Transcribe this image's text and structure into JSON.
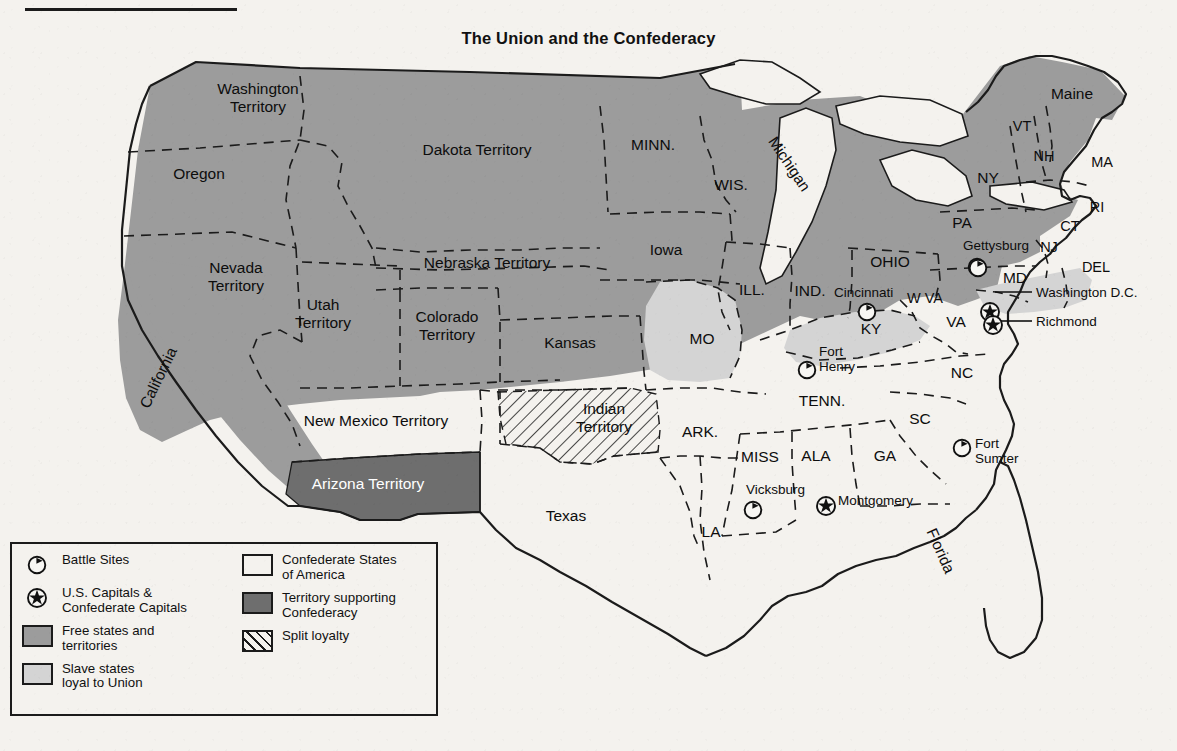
{
  "title": "The Union and the Confederacy",
  "colors": {
    "paper": "#f4f2ee",
    "free_states": "#9c9c9c",
    "slave_loyal": "#d4d4d4",
    "confederate": "#f4f2ee",
    "territory_supporting": "#6e6e6e",
    "ink": "#1b1b1b"
  },
  "legend": {
    "left_column": [
      {
        "mark": "battle-site-icon",
        "label": "Battle Sites"
      },
      {
        "mark": "capital-star-icon",
        "label": "U.S. Capitals &\nConfederate Capitals"
      },
      {
        "mark": "swatch-free",
        "label": "Free states and\nterritories"
      },
      {
        "mark": "swatch-slave",
        "label": "Slave states\nloyal to Union"
      }
    ],
    "right_column": [
      {
        "mark": "swatch-confederate",
        "label": "Confederate States\nof America"
      },
      {
        "mark": "swatch-dark",
        "label": "Territory supporting\nConfederacy"
      },
      {
        "mark": "swatch-split",
        "label": "Split loyalty"
      }
    ]
  },
  "map": {
    "free_states_and_territories": [
      {
        "name": "Washington Territory",
        "lines": [
          "Washington",
          "Territory"
        ],
        "x": 258,
        "y": 94,
        "size": "sz15"
      },
      {
        "name": "Oregon",
        "lines": [
          "Oregon"
        ],
        "x": 199,
        "y": 179,
        "size": "sz15"
      },
      {
        "name": "Dakota Territory",
        "lines": [
          "Dakota Territory"
        ],
        "x": 477,
        "y": 155,
        "size": "sz15"
      },
      {
        "name": "Nevada Territory",
        "lines": [
          "Nevada",
          "Territory"
        ],
        "x": 236,
        "y": 273,
        "size": "sz15"
      },
      {
        "name": "Utah Territory",
        "lines": [
          "Utah",
          "Territory"
        ],
        "x": 323,
        "y": 310,
        "size": "sz15"
      },
      {
        "name": "Colorado Territory",
        "lines": [
          "Colorado",
          "Territory"
        ],
        "x": 447,
        "y": 322,
        "size": "sz15"
      },
      {
        "name": "Nebraska Territory",
        "lines": [
          "Nebraska Territory"
        ],
        "x": 487,
        "y": 268,
        "size": "sz15"
      },
      {
        "name": "Kansas",
        "lines": [
          "Kansas"
        ],
        "x": 570,
        "y": 348,
        "size": "sz15"
      },
      {
        "name": "New Mexico Territory",
        "lines": [
          "New Mexico Territory"
        ],
        "x": 376,
        "y": 426,
        "size": "sz15"
      },
      {
        "name": "California",
        "lines": [
          "California"
        ],
        "x": 163,
        "y": 380,
        "size": "sz15",
        "rotate": -64
      },
      {
        "name": "MINN.",
        "lines": [
          "MINN."
        ],
        "x": 653,
        "y": 150,
        "size": "sz15"
      },
      {
        "name": "WIS.",
        "lines": [
          "WIS."
        ],
        "x": 731,
        "y": 190,
        "size": "sz15"
      },
      {
        "name": "Michigan",
        "lines": [
          "Michigan"
        ],
        "x": 785,
        "y": 167,
        "size": "sz15",
        "rotate": 56
      },
      {
        "name": "Iowa",
        "lines": [
          "Iowa"
        ],
        "x": 666,
        "y": 255,
        "size": "sz15"
      },
      {
        "name": "ILL.",
        "lines": [
          "ILL."
        ],
        "x": 752,
        "y": 295,
        "size": "sz15"
      },
      {
        "name": "IND.",
        "lines": [
          "IND."
        ],
        "x": 810,
        "y": 296,
        "size": "sz15"
      },
      {
        "name": "OHIO",
        "lines": [
          "OHIO"
        ],
        "x": 890,
        "y": 267,
        "size": "sz15"
      },
      {
        "name": "PA",
        "lines": [
          "PA"
        ],
        "x": 962,
        "y": 228,
        "size": "sz15"
      },
      {
        "name": "NY",
        "lines": [
          "NY"
        ],
        "x": 988,
        "y": 183,
        "size": "sz15"
      },
      {
        "name": "Maine",
        "lines": [
          "Maine"
        ],
        "x": 1072,
        "y": 99,
        "size": "sz15"
      },
      {
        "name": "VT",
        "lines": [
          "VT"
        ],
        "x": 1022,
        "y": 131,
        "size": "sz14"
      },
      {
        "name": "NH",
        "lines": [
          "NH"
        ],
        "x": 1044,
        "y": 161,
        "size": "sz14"
      },
      {
        "name": "MA",
        "lines": [
          "MA"
        ],
        "x": 1102,
        "y": 167,
        "size": "sz14"
      },
      {
        "name": "RI",
        "lines": [
          "RI"
        ],
        "x": 1097,
        "y": 212,
        "size": "sz14"
      },
      {
        "name": "CT",
        "lines": [
          "CT"
        ],
        "x": 1070,
        "y": 231,
        "size": "sz14"
      },
      {
        "name": "NJ",
        "lines": [
          "NJ"
        ],
        "x": 1049,
        "y": 252,
        "size": "sz14"
      },
      {
        "name": "W VA",
        "lines": [
          "W VA"
        ],
        "x": 925,
        "y": 303,
        "size": "sz14"
      }
    ],
    "slave_states_loyal_to_union": [
      {
        "name": "MO",
        "lines": [
          "MO"
        ],
        "x": 702,
        "y": 344,
        "size": "sz15"
      },
      {
        "name": "KY",
        "lines": [
          "KY"
        ],
        "x": 871,
        "y": 334,
        "size": "sz15"
      },
      {
        "name": "MD",
        "lines": [
          "MD"
        ],
        "x": 1015,
        "y": 283,
        "size": "sz15"
      },
      {
        "name": "DEL",
        "lines": [
          "DEL"
        ],
        "x": 1096,
        "y": 272,
        "size": "sz14"
      }
    ],
    "confederate_states": [
      {
        "name": "VA",
        "lines": [
          "VA"
        ],
        "x": 956,
        "y": 327,
        "size": "sz15"
      },
      {
        "name": "NC",
        "lines": [
          "NC"
        ],
        "x": 962,
        "y": 378,
        "size": "sz15"
      },
      {
        "name": "SC",
        "lines": [
          "SC"
        ],
        "x": 920,
        "y": 424,
        "size": "sz15"
      },
      {
        "name": "GA",
        "lines": [
          "GA"
        ],
        "x": 885,
        "y": 461,
        "size": "sz15"
      },
      {
        "name": "TENN.",
        "lines": [
          "TENN."
        ],
        "x": 822,
        "y": 406,
        "size": "sz15"
      },
      {
        "name": "ALA",
        "lines": [
          "ALA"
        ],
        "x": 816,
        "y": 461,
        "size": "sz15"
      },
      {
        "name": "MISS",
        "lines": [
          "MISS"
        ],
        "x": 760,
        "y": 462,
        "size": "sz15"
      },
      {
        "name": "ARK.",
        "lines": [
          "ARK."
        ],
        "x": 700,
        "y": 437,
        "size": "sz15"
      },
      {
        "name": "LA",
        "lines": [
          "LA"
        ],
        "x": 711,
        "y": 537,
        "size": "sz15"
      },
      {
        "name": "Texas",
        "lines": [
          "Texas"
        ],
        "x": 566,
        "y": 521,
        "size": "sz15"
      },
      {
        "name": "Florida",
        "lines": [
          "Florida"
        ],
        "x": 936,
        "y": 553,
        "size": "sz15",
        "rotate": 66
      }
    ],
    "split_loyalty": [
      {
        "name": "Indian Territory",
        "lines": [
          "Indian",
          "Territory"
        ],
        "x": 604,
        "y": 414,
        "size": "sz15"
      }
    ],
    "territory_supporting_confederacy": [
      {
        "name": "Arizona Territory",
        "lines": [
          "Arizona Territory"
        ],
        "x": 368,
        "y": 489,
        "size": "sz15",
        "white": true
      }
    ],
    "battle_sites": [
      {
        "name": "Gettysburg",
        "label": "Gettysburg",
        "lx": 963,
        "ly": 250,
        "anchor": "start",
        "mx": 977,
        "my": 267
      },
      {
        "name": "Cincinnati",
        "label": "Cincinnati",
        "lx": 834,
        "ly": 297,
        "anchor": "start",
        "mx": 867,
        "my": 312
      },
      {
        "name": "Fort Henry",
        "label": "Fort\nHenry",
        "lx": 819,
        "ly": 356,
        "anchor": "start",
        "mx": 807,
        "my": 370
      },
      {
        "name": "Fort Sumter",
        "label": "Fort\nSumter",
        "lx": 975,
        "ly": 448,
        "anchor": "start",
        "mx": 962,
        "my": 448
      },
      {
        "name": "Vicksburg",
        "label": "Vicksburg",
        "lx": 746,
        "ly": 494,
        "anchor": "start",
        "mx": 753,
        "my": 510
      },
      {
        "name": "Unnamed Maryland site",
        "label": "",
        "lx": 0,
        "ly": 0,
        "anchor": "start",
        "mx": 978,
        "my": 268
      }
    ],
    "capitals": [
      {
        "name": "Washington D.C.",
        "label": "Washington D.C.",
        "lx": 1036,
        "ly": 297,
        "mx": 990,
        "my": 312,
        "leader": [
          1032,
          292,
          995,
          292
        ]
      },
      {
        "name": "Richmond",
        "label": "Richmond",
        "lx": 1036,
        "ly": 326,
        "mx": 993,
        "my": 325,
        "leader": [
          1032,
          321,
          1000,
          321
        ]
      },
      {
        "name": "Montgomery",
        "label": "Montgomery",
        "lx": 838,
        "ly": 505,
        "mx": 826,
        "my": 506
      }
    ]
  }
}
